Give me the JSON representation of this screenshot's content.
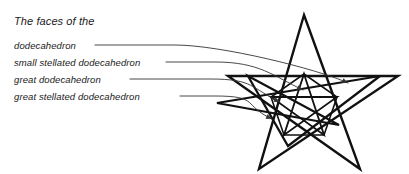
{
  "title": {
    "text": "The faces of the"
  },
  "legend": {
    "items": [
      {
        "label": "dodecahedron"
      },
      {
        "label": "small stellated dodecahedron"
      },
      {
        "label": "great dodecahedron"
      },
      {
        "label": "great stellated dodecahedron"
      }
    ]
  },
  "colors": {
    "ink": "#1a1a1a",
    "figure_stroke": "#111111",
    "leader_stroke": "#333333",
    "background": "#ffffff"
  },
  "figure": {
    "name": "nested-pentagram-diagram",
    "outer_star_points": [
      [
        304,
        15
      ],
      [
        398,
        76
      ],
      [
        360,
        169
      ],
      [
        259,
        169
      ],
      [
        228,
        76
      ]
    ],
    "inner_pentagon_points": [
      [
        304,
        74
      ],
      [
        337,
        97
      ],
      [
        324,
        135
      ],
      [
        284,
        135
      ],
      [
        271,
        97
      ]
    ],
    "mid_pentagon_points": [
      [
        248,
        76
      ],
      [
        380,
        76
      ],
      [
        339,
        125
      ],
      [
        288,
        146
      ],
      [
        217,
        103
      ]
    ]
  },
  "leaders": {
    "count": 4,
    "target_ends": [
      [
        348,
        83
      ],
      [
        303,
        90
      ],
      [
        280,
        102
      ],
      [
        272,
        119
      ]
    ],
    "arrowheads": [
      true,
      true,
      true,
      true
    ],
    "line_start_x": [
      95,
      166,
      130,
      180
    ],
    "line_y": [
      45,
      62,
      79,
      96
    ]
  }
}
